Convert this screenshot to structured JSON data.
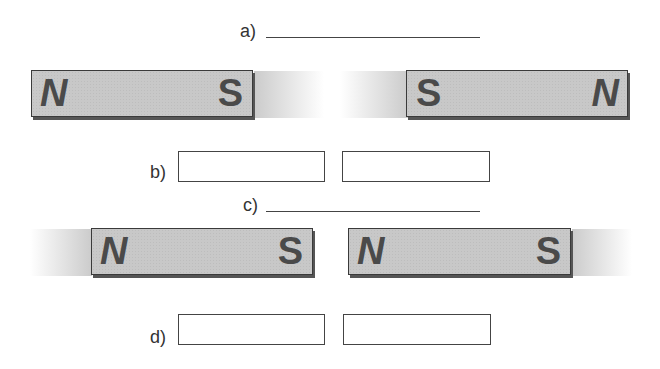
{
  "questions": {
    "a": {
      "label": "a)"
    },
    "b": {
      "label": "b)"
    },
    "c": {
      "label": "c)"
    },
    "d": {
      "label": "d)"
    }
  },
  "diagram1": {
    "left_magnet": {
      "left_pole": "N",
      "right_pole": "S"
    },
    "right_magnet": {
      "left_pole": "S",
      "right_pole": "N"
    }
  },
  "diagram2": {
    "left_magnet": {
      "left_pole": "N",
      "right_pole": "S"
    },
    "right_magnet": {
      "left_pole": "N",
      "right_pole": "S"
    }
  },
  "answer_boxes": {
    "b": [
      "",
      ""
    ],
    "d": [
      "",
      ""
    ]
  },
  "colors": {
    "magnet_fill": "#c8c8c8",
    "outline": "#3a3a3a",
    "pole_text": "#4a4a4a"
  }
}
